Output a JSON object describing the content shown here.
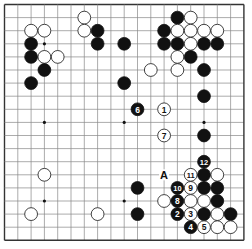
{
  "board": {
    "size": 19,
    "origin_x": 4.5,
    "origin_y": 4.5,
    "step_x": 13.3,
    "step_y": 13.1,
    "line_color": "#888888",
    "edge_color": "#333333",
    "star_points": [
      [
        3,
        3
      ],
      [
        9,
        3
      ],
      [
        15,
        3
      ],
      [
        3,
        9
      ],
      [
        9,
        9
      ],
      [
        15,
        9
      ],
      [
        3,
        15
      ],
      [
        9,
        15
      ],
      [
        15,
        15
      ]
    ],
    "black_color": "#111111",
    "white_color": "#ffffff"
  },
  "stones": [
    {
      "c": 2,
      "r": 2,
      "color": "white"
    },
    {
      "c": 3,
      "r": 2,
      "color": "white"
    },
    {
      "c": 6,
      "r": 1,
      "color": "white"
    },
    {
      "c": 6,
      "r": 2,
      "color": "white"
    },
    {
      "c": 7,
      "r": 2,
      "color": "black"
    },
    {
      "c": 7,
      "r": 3,
      "color": "black"
    },
    {
      "c": 2,
      "r": 3,
      "color": "black"
    },
    {
      "c": 9,
      "r": 3,
      "color": "black"
    },
    {
      "c": 2,
      "r": 4,
      "color": "black"
    },
    {
      "c": 3,
      "r": 4,
      "color": "white"
    },
    {
      "c": 4,
      "r": 4,
      "color": "white"
    },
    {
      "c": 3,
      "r": 5,
      "color": "black"
    },
    {
      "c": 2,
      "r": 6,
      "color": "black"
    },
    {
      "c": 9,
      "r": 6,
      "color": "black"
    },
    {
      "c": 13,
      "r": 1,
      "color": "black"
    },
    {
      "c": 14,
      "r": 1,
      "color": "white"
    },
    {
      "c": 12,
      "r": 2,
      "color": "black"
    },
    {
      "c": 13,
      "r": 2,
      "color": "white"
    },
    {
      "c": 14,
      "r": 2,
      "color": "white"
    },
    {
      "c": 15,
      "r": 2,
      "color": "white"
    },
    {
      "c": 16,
      "r": 2,
      "color": "white"
    },
    {
      "c": 12,
      "r": 3,
      "color": "black"
    },
    {
      "c": 13,
      "r": 3,
      "color": "black"
    },
    {
      "c": 14,
      "r": 3,
      "color": "white"
    },
    {
      "c": 15,
      "r": 3,
      "color": "black"
    },
    {
      "c": 16,
      "r": 3,
      "color": "black"
    },
    {
      "c": 13,
      "r": 4,
      "color": "white"
    },
    {
      "c": 14,
      "r": 4,
      "color": "black"
    },
    {
      "c": 11,
      "r": 5,
      "color": "white"
    },
    {
      "c": 13,
      "r": 5,
      "color": "white"
    },
    {
      "c": 15,
      "r": 5,
      "color": "black"
    },
    {
      "c": 15,
      "r": 7,
      "color": "black"
    },
    {
      "c": 10,
      "r": 8,
      "color": "black",
      "label": "6"
    },
    {
      "c": 12,
      "r": 8,
      "color": "white",
      "label": "1"
    },
    {
      "c": 12,
      "r": 10,
      "color": "white",
      "label": "7"
    },
    {
      "c": 15,
      "r": 10,
      "color": "black"
    },
    {
      "c": 15,
      "r": 12,
      "color": "black",
      "label": "12"
    },
    {
      "c": 14,
      "r": 13,
      "color": "white",
      "label": "11"
    },
    {
      "c": 15,
      "r": 13,
      "color": "black"
    },
    {
      "c": 16,
      "r": 13,
      "color": "white"
    },
    {
      "c": 10,
      "r": 14,
      "color": "black"
    },
    {
      "c": 13,
      "r": 14,
      "color": "black",
      "label": "10"
    },
    {
      "c": 14,
      "r": 14,
      "color": "white",
      "label": "9"
    },
    {
      "c": 15,
      "r": 14,
      "color": "black"
    },
    {
      "c": 16,
      "r": 14,
      "color": "black"
    },
    {
      "c": 12,
      "r": 15,
      "color": "white"
    },
    {
      "c": 13,
      "r": 15,
      "color": "black",
      "label": "8"
    },
    {
      "c": 14,
      "r": 15,
      "color": "white"
    },
    {
      "c": 15,
      "r": 15,
      "color": "white"
    },
    {
      "c": 16,
      "r": 15,
      "color": "black"
    },
    {
      "c": 10,
      "r": 16,
      "color": "black"
    },
    {
      "c": 13,
      "r": 16,
      "color": "black",
      "label": "2"
    },
    {
      "c": 14,
      "r": 16,
      "color": "white",
      "label": "3"
    },
    {
      "c": 15,
      "r": 16,
      "color": "black"
    },
    {
      "c": 16,
      "r": 16,
      "color": "white"
    },
    {
      "c": 17,
      "r": 16,
      "color": "black"
    },
    {
      "c": 14,
      "r": 17,
      "color": "black",
      "label": "4"
    },
    {
      "c": 15,
      "r": 17,
      "color": "white",
      "label": "5"
    },
    {
      "c": 16,
      "r": 17,
      "color": "white"
    },
    {
      "c": 17,
      "r": 17,
      "color": "white"
    },
    {
      "c": 3,
      "r": 13,
      "color": "white"
    },
    {
      "c": 2,
      "r": 16,
      "color": "white"
    },
    {
      "c": 7,
      "r": 16,
      "color": "white"
    }
  ],
  "markers": [
    {
      "c": 12,
      "r": 13,
      "label": "A"
    }
  ]
}
